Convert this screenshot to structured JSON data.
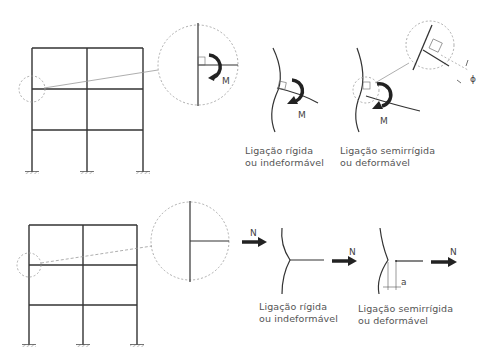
{
  "diagram": {
    "top_row": {
      "subject": "bending moment at beam-column connection",
      "moment_symbol": "M",
      "rotation_symbol": "ϕ",
      "captions": [
        {
          "line1": "Ligação rígida",
          "line2": "ou indeformável"
        },
        {
          "line1": "Ligação semirrígida",
          "line2": "ou deformável"
        }
      ]
    },
    "bottom_row": {
      "subject": "axial force at beam-column connection",
      "force_symbol": "N",
      "displacement_symbol": "a",
      "captions": [
        {
          "line1": "Ligação rígida",
          "line2": "ou indeformável"
        },
        {
          "line1": "Ligação semirrígida",
          "line2": "ou deformável"
        }
      ]
    },
    "colors": {
      "line": "#333333",
      "dashed": "#999999",
      "text": "#555555"
    }
  }
}
